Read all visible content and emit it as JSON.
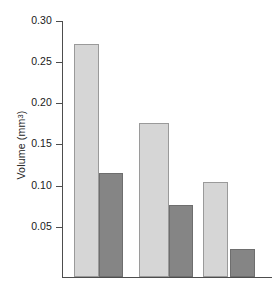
{
  "chart_data": {
    "type": "bar",
    "title": "",
    "xlabel": "",
    "ylabel": "Volume (mm3)",
    "ylabel_base": "Volume (mm",
    "ylabel_sup": "3",
    "ylabel_tail": ")",
    "categories": [
      "Group 1",
      "Group 2",
      "Group 3"
    ],
    "ylim": [
      0,
      0.3
    ],
    "yticks": [
      0.3,
      0.25,
      0.2,
      0.15,
      0.1,
      0.05
    ],
    "ytick_labels": [
      "0.30",
      "0.25",
      "0.20",
      "0.15",
      "0.10",
      "0.05"
    ],
    "grid": false,
    "legend": "none",
    "xtick_labels": [
      "",
      "",
      ""
    ],
    "series": [
      {
        "name": "Light bars",
        "color": "#d6d6d6",
        "edge_color": "#9a9a9a",
        "values": [
          0.266,
          0.17,
          0.115
        ]
      },
      {
        "name": "Dark bars",
        "color": "#858585",
        "edge_color": "#6e6e6e",
        "values": [
          0.121,
          0.083,
          0.034
        ]
      }
    ]
  },
  "layout": {
    "axis_color": "#4d4d4d",
    "background": "#ffffff",
    "plot_left": 62,
    "plot_baseline": 277,
    "plot_top": 21,
    "bar_geometry": [
      {
        "name": "bar-light-1",
        "x": 74,
        "width": 25,
        "top": 44,
        "series": 0,
        "index": 0
      },
      {
        "name": "bar-dark-1",
        "x": 99,
        "width": 24,
        "top": 173,
        "series": 1,
        "index": 0
      },
      {
        "name": "bar-light-2",
        "x": 139,
        "width": 30,
        "top": 123,
        "series": 0,
        "index": 1
      },
      {
        "name": "bar-dark-2",
        "x": 169,
        "width": 24,
        "top": 205,
        "series": 1,
        "index": 1
      },
      {
        "name": "bar-light-3",
        "x": 203,
        "width": 25,
        "top": 182,
        "series": 0,
        "index": 2
      },
      {
        "name": "bar-dark-3",
        "x": 230,
        "width": 25,
        "top": 249,
        "series": 1,
        "index": 2
      }
    ],
    "tick_y": [
      21,
      62,
      103,
      144,
      186,
      227
    ]
  }
}
